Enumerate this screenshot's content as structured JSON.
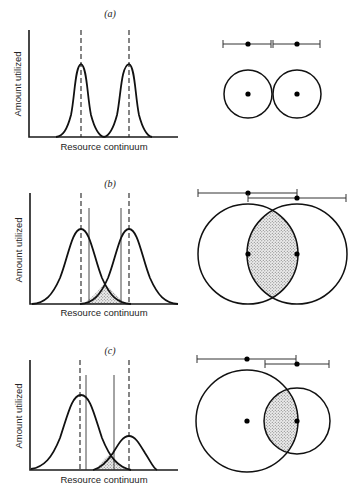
{
  "figure": {
    "colors": {
      "ink": "#111111",
      "background": "#ffffff",
      "stipple": "#9a9a9a"
    },
    "panels": [
      {
        "id": "a",
        "label": "(a)",
        "y_axis_label": "Amount utilized",
        "x_axis_label": "Resource continuum",
        "description": "Two narrow, non-overlapping utilization curves with means marked by dashed lines",
        "overlap": "none",
        "venn": "two equal tangent circles, centers marked; range bars abut"
      },
      {
        "id": "b",
        "label": "(b)",
        "y_axis_label": "Amount utilized",
        "x_axis_label": "Resource continuum",
        "description": "Two broad equal-height curves overlapping; shared area stippled between solid limit lines",
        "overlap": "partial",
        "venn": "two equal circles, each centered on the other's edge; lens overlap stippled"
      },
      {
        "id": "c",
        "label": "(c)",
        "y_axis_label": "Amount utilized",
        "x_axis_label": "Resource continuum",
        "description": "One large broad curve and one smaller curve; small overlap stippled",
        "overlap": "asymmetric",
        "venn": "large circle and smaller circle centered on its edge; overlap stippled"
      }
    ]
  }
}
